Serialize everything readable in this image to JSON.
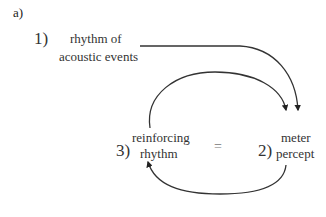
{
  "panel_label": "a)",
  "nodes": [
    {
      "id": "1",
      "number": "1)",
      "lines": [
        "rhythm of",
        "acoustic events"
      ]
    },
    {
      "id": "2",
      "number": "2)",
      "lines": [
        "meter",
        "percept"
      ]
    },
    {
      "id": "3",
      "number": "3)",
      "lines": [
        "reinforcing",
        "rhythm"
      ]
    }
  ],
  "equals_symbol": "=",
  "edges": [
    {
      "from": "1",
      "to": "2",
      "style": "solid-arrow"
    },
    {
      "from": "3",
      "to": "2",
      "style": "solid-arrow"
    },
    {
      "from": "2",
      "to": "3",
      "style": "solid-arrow"
    }
  ],
  "colors": {
    "stroke": "#333333",
    "text": "#333333",
    "equals": "#777777"
  }
}
